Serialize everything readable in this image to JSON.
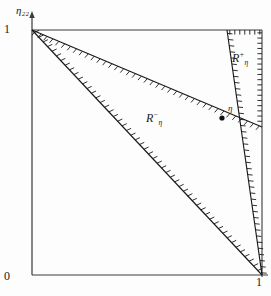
{
  "figure": {
    "kind": "region-diagram"
  },
  "axes": {
    "y_axis_label": "η₂₂",
    "origin_label": "0",
    "y_tick_label": "1",
    "x_tick_label": "1",
    "x_range": [
      0,
      1
    ],
    "y_range": [
      0,
      1
    ]
  },
  "labels": {
    "region_minus": "R",
    "region_minus_sup": "−",
    "region_minus_sub": "η",
    "region_plus": "R",
    "region_plus_sup": "+",
    "region_plus_sub": "η",
    "point_eta": "η"
  },
  "colors": {
    "ink": "#1a1a1a",
    "frame": "#3a3a3a",
    "background": "#fdfdfd"
  },
  "chart_data": {
    "type": "line",
    "title": "",
    "xlabel": "",
    "ylabel": "η₂₂",
    "xlim": [
      0,
      1
    ],
    "ylim": [
      0,
      1
    ],
    "grid": false,
    "legend": "none",
    "annotations": [
      {
        "name": "point-eta",
        "text": "η",
        "x": 0.826,
        "y": 0.641
      },
      {
        "name": "region-minus",
        "text": "R⁻η",
        "x": 0.5,
        "y": 0.63
      },
      {
        "name": "region-plus",
        "text": "R⁺η",
        "x": 0.875,
        "y": 0.87
      }
    ],
    "series": [
      {
        "name": "upper-boundary",
        "hatch_side": "upper",
        "points": [
          [
            0.0,
            1.0
          ],
          [
            1.0,
            0.604
          ]
        ]
      },
      {
        "name": "lower-boundary",
        "hatch_side": "upper",
        "points": [
          [
            0.0,
            1.0
          ],
          [
            1.0,
            0.0
          ]
        ]
      },
      {
        "name": "steep-boundary",
        "hatch_side": "right",
        "points": [
          [
            0.848,
            1.0
          ],
          [
            1.0,
            0.0
          ]
        ]
      },
      {
        "name": "top-frame-segment",
        "hatch_side": "below",
        "points": [
          [
            0.848,
            1.0
          ],
          [
            1.0,
            1.0
          ]
        ]
      },
      {
        "name": "right-frame-segment",
        "hatch_side": "left",
        "points": [
          [
            1.0,
            1.0
          ],
          [
            1.0,
            0.604
          ]
        ]
      }
    ]
  }
}
